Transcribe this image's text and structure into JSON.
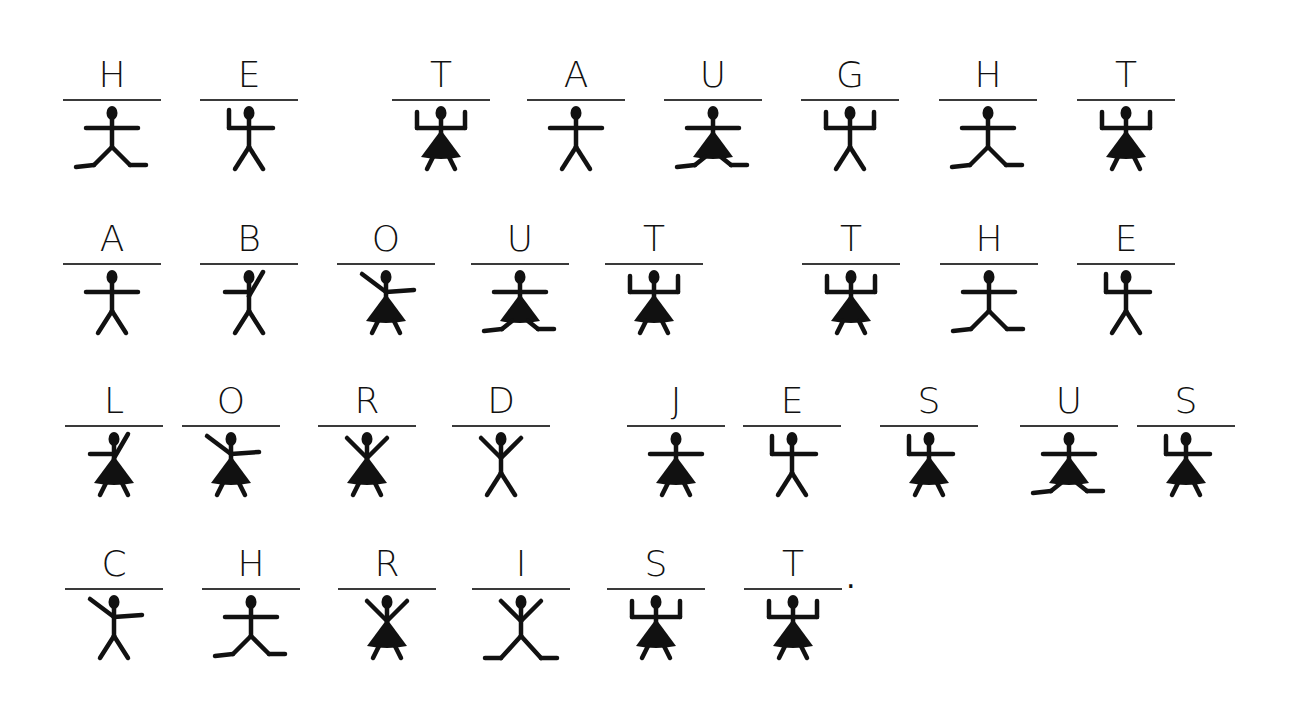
{
  "colors": {
    "ink": "#111111",
    "rule": "#3a3a3a",
    "paper": "#ffffff"
  },
  "trailing_punctuation": ".",
  "rows": [
    {
      "y": 55,
      "cells": [
        {
          "x": 63,
          "letter": "H",
          "pose": {
            "arms": "straight",
            "legs": "splits",
            "skirt": false
          }
        },
        {
          "x": 200,
          "letter": "E",
          "pose": {
            "arms": "left-up",
            "legs": "v",
            "skirt": false
          }
        },
        {
          "x": 392,
          "letter": "T",
          "pose": {
            "arms": "up-both",
            "legs": "v",
            "skirt": true
          }
        },
        {
          "x": 527,
          "letter": "A",
          "pose": {
            "arms": "straight",
            "legs": "v",
            "skirt": false
          }
        },
        {
          "x": 664,
          "letter": "U",
          "pose": {
            "arms": "straight",
            "legs": "splits",
            "skirt": true
          }
        },
        {
          "x": 801,
          "letter": "G",
          "pose": {
            "arms": "up-both",
            "legs": "v",
            "skirt": false
          }
        },
        {
          "x": 939,
          "letter": "H",
          "pose": {
            "arms": "straight",
            "legs": "splits",
            "skirt": false
          }
        },
        {
          "x": 1077,
          "letter": "T",
          "pose": {
            "arms": "up-both",
            "legs": "v",
            "skirt": true
          }
        }
      ]
    },
    {
      "y": 219,
      "cells": [
        {
          "x": 63,
          "letter": "A",
          "pose": {
            "arms": "straight",
            "legs": "v",
            "skirt": false
          }
        },
        {
          "x": 200,
          "letter": "B",
          "pose": {
            "arms": "right-diag",
            "legs": "v",
            "skirt": false
          }
        },
        {
          "x": 337,
          "letter": "O",
          "pose": {
            "arms": "left-diag",
            "legs": "v",
            "skirt": true
          }
        },
        {
          "x": 471,
          "letter": "U",
          "pose": {
            "arms": "straight",
            "legs": "splits",
            "skirt": true
          }
        },
        {
          "x": 605,
          "letter": "T",
          "pose": {
            "arms": "up-both",
            "legs": "v",
            "skirt": true
          }
        },
        {
          "x": 802,
          "letter": "T",
          "pose": {
            "arms": "up-both",
            "legs": "v",
            "skirt": true
          }
        },
        {
          "x": 940,
          "letter": "H",
          "pose": {
            "arms": "straight",
            "legs": "splits",
            "skirt": false
          }
        },
        {
          "x": 1077,
          "letter": "E",
          "pose": {
            "arms": "left-up",
            "legs": "v",
            "skirt": false
          }
        }
      ]
    },
    {
      "y": 381,
      "cells": [
        {
          "x": 65,
          "letter": "L",
          "pose": {
            "arms": "right-diag",
            "legs": "v",
            "skirt": true
          }
        },
        {
          "x": 182,
          "letter": "O",
          "pose": {
            "arms": "left-diag",
            "legs": "v",
            "skirt": true
          }
        },
        {
          "x": 318,
          "letter": "R",
          "pose": {
            "arms": "both-diag",
            "legs": "v",
            "skirt": true
          }
        },
        {
          "x": 452,
          "letter": "D",
          "pose": {
            "arms": "both-diag",
            "legs": "v",
            "skirt": false
          }
        },
        {
          "x": 627,
          "letter": "J",
          "pose": {
            "arms": "straight",
            "legs": "v",
            "skirt": true
          }
        },
        {
          "x": 743,
          "letter": "E",
          "pose": {
            "arms": "left-up",
            "legs": "v",
            "skirt": false
          }
        },
        {
          "x": 880,
          "letter": "S",
          "pose": {
            "arms": "left-up",
            "legs": "v",
            "skirt": true
          }
        },
        {
          "x": 1020,
          "letter": "U",
          "pose": {
            "arms": "straight",
            "legs": "splits",
            "skirt": true
          }
        },
        {
          "x": 1137,
          "letter": "S",
          "pose": {
            "arms": "left-up",
            "legs": "v",
            "skirt": true
          }
        }
      ]
    },
    {
      "y": 544,
      "cells": [
        {
          "x": 65,
          "letter": "C",
          "pose": {
            "arms": "left-diag",
            "legs": "v",
            "skirt": false
          }
        },
        {
          "x": 202,
          "letter": "H",
          "pose": {
            "arms": "straight",
            "legs": "splits",
            "skirt": false
          }
        },
        {
          "x": 338,
          "letter": "R",
          "pose": {
            "arms": "both-diag",
            "legs": "v",
            "skirt": true
          }
        },
        {
          "x": 472,
          "letter": "I",
          "pose": {
            "arms": "both-diag",
            "legs": "x-splits",
            "skirt": false
          }
        },
        {
          "x": 607,
          "letter": "S",
          "pose": {
            "arms": "up-both",
            "legs": "v",
            "skirt": true
          }
        },
        {
          "x": 744,
          "letter": "T",
          "pose": {
            "arms": "up-both",
            "legs": "v",
            "skirt": true
          }
        }
      ]
    }
  ],
  "period_position": {
    "x": 846,
    "y": 560
  }
}
